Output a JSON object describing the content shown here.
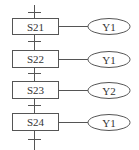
{
  "diagram": {
    "type": "SFC step ladder",
    "steps": [
      {
        "label": "S21",
        "output": "Y1"
      },
      {
        "label": "S22",
        "output": "Y1"
      },
      {
        "label": "S23",
        "output": "Y2"
      },
      {
        "label": "S24",
        "output": "Y1"
      }
    ]
  }
}
